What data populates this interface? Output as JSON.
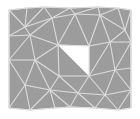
{
  "diagram": {
    "type": "triangular-mesh",
    "colors": {
      "background": "#ffffff",
      "fill": "#9c9c9c",
      "edge": "#dcdcdc",
      "hole": "#ffffff"
    },
    "domain_outline": [
      [
        9,
        10
      ],
      [
        27,
        8
      ],
      [
        44,
        7
      ],
      [
        70,
        8
      ],
      [
        98,
        7
      ],
      [
        118,
        8
      ],
      [
        131,
        10
      ],
      [
        131,
        108
      ],
      [
        118,
        110
      ],
      [
        95,
        108
      ],
      [
        70,
        107
      ],
      [
        55,
        108
      ],
      [
        30,
        110
      ],
      [
        9,
        108
      ]
    ],
    "hole": [
      [
        58,
        45
      ],
      [
        89,
        46
      ],
      [
        89,
        76
      ]
    ],
    "vertices": [
      [
        9,
        10
      ],
      [
        27,
        8
      ],
      [
        44,
        7
      ],
      [
        70,
        8
      ],
      [
        98,
        7
      ],
      [
        118,
        8
      ],
      [
        131,
        10
      ],
      [
        25,
        27
      ],
      [
        52,
        18
      ],
      [
        75,
        14
      ],
      [
        100,
        15
      ],
      [
        125,
        30
      ],
      [
        9,
        36
      ],
      [
        30,
        35
      ],
      [
        58,
        45
      ],
      [
        89,
        46
      ],
      [
        110,
        42
      ],
      [
        131,
        42
      ],
      [
        9,
        60
      ],
      [
        35,
        60
      ],
      [
        59,
        76
      ],
      [
        89,
        76
      ],
      [
        115,
        70
      ],
      [
        131,
        68
      ],
      [
        25,
        85
      ],
      [
        50,
        90
      ],
      [
        78,
        93
      ],
      [
        105,
        95
      ],
      [
        131,
        90
      ],
      [
        9,
        108
      ],
      [
        30,
        110
      ],
      [
        55,
        108
      ],
      [
        70,
        107
      ],
      [
        95,
        108
      ],
      [
        118,
        110
      ],
      [
        131,
        108
      ]
    ],
    "edges": [
      [
        0,
        1
      ],
      [
        1,
        2
      ],
      [
        2,
        3
      ],
      [
        3,
        4
      ],
      [
        4,
        5
      ],
      [
        5,
        6
      ],
      [
        0,
        7
      ],
      [
        1,
        7
      ],
      [
        2,
        7
      ],
      [
        2,
        8
      ],
      [
        3,
        8
      ],
      [
        3,
        9
      ],
      [
        4,
        9
      ],
      [
        4,
        10
      ],
      [
        5,
        10
      ],
      [
        5,
        11
      ],
      [
        6,
        11
      ],
      [
        7,
        8
      ],
      [
        8,
        9
      ],
      [
        9,
        10
      ],
      [
        10,
        11
      ],
      [
        0,
        12
      ],
      [
        7,
        12
      ],
      [
        7,
        13
      ],
      [
        8,
        13
      ],
      [
        8,
        14
      ],
      [
        9,
        14
      ],
      [
        9,
        15
      ],
      [
        10,
        15
      ],
      [
        10,
        16
      ],
      [
        11,
        16
      ],
      [
        11,
        17
      ],
      [
        6,
        17
      ],
      [
        12,
        13
      ],
      [
        13,
        14
      ],
      [
        14,
        15
      ],
      [
        15,
        16
      ],
      [
        16,
        17
      ],
      [
        12,
        18
      ],
      [
        13,
        18
      ],
      [
        13,
        19
      ],
      [
        14,
        19
      ],
      [
        19,
        20
      ],
      [
        14,
        20
      ],
      [
        15,
        21
      ],
      [
        16,
        21
      ],
      [
        16,
        22
      ],
      [
        17,
        22
      ],
      [
        17,
        23
      ],
      [
        18,
        19
      ],
      [
        20,
        21
      ],
      [
        21,
        22
      ],
      [
        22,
        23
      ],
      [
        18,
        24
      ],
      [
        19,
        24
      ],
      [
        19,
        25
      ],
      [
        20,
        25
      ],
      [
        20,
        26
      ],
      [
        21,
        26
      ],
      [
        21,
        27
      ],
      [
        22,
        27
      ],
      [
        22,
        28
      ],
      [
        23,
        28
      ],
      [
        24,
        25
      ],
      [
        25,
        26
      ],
      [
        26,
        27
      ],
      [
        27,
        28
      ],
      [
        18,
        29
      ],
      [
        24,
        29
      ],
      [
        24,
        30
      ],
      [
        25,
        30
      ],
      [
        25,
        31
      ],
      [
        25,
        32
      ],
      [
        26,
        32
      ],
      [
        26,
        33
      ],
      [
        27,
        33
      ],
      [
        27,
        34
      ],
      [
        28,
        34
      ],
      [
        28,
        35
      ],
      [
        29,
        30
      ],
      [
        30,
        31
      ],
      [
        31,
        32
      ],
      [
        32,
        33
      ],
      [
        33,
        34
      ],
      [
        34,
        35
      ]
    ]
  }
}
